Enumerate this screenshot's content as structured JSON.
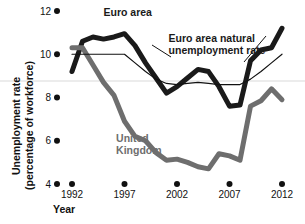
{
  "chart_data": {
    "type": "line",
    "title": "",
    "xlabel": "Year",
    "ylabel": "Unemployment rate (percentage of workforce)",
    "ylabel_line1": "Unemployment rate",
    "ylabel_line2": "(percentage of workforce)",
    "xlim": [
      1991,
      2012.6
    ],
    "ylim": [
      4,
      12
    ],
    "grid": "single horizontal reference line at 8.7",
    "gridline_value": 8.7,
    "x_ticks": [
      1992,
      1997,
      2002,
      2007,
      2012
    ],
    "x_tick_labels": [
      "1992",
      "1997",
      "2002",
      "2007",
      "2012"
    ],
    "y_ticks": [
      4,
      6,
      8,
      10,
      12
    ],
    "y_tick_labels": [
      "4",
      "6",
      "8",
      "10",
      "12"
    ],
    "legend_position": "inline annotations on curves",
    "series": [
      {
        "name": "Euro area",
        "label": "Euro area",
        "color": "#1a1a1a",
        "width": 5,
        "label_x": 1995.0,
        "label_y": 11.75,
        "x": [
          1992,
          1993,
          1994,
          1995,
          1996,
          1997,
          1998,
          1999,
          2000,
          2001,
          2002,
          2003,
          2004,
          2005,
          2006,
          2007,
          2008,
          2009,
          2010,
          2011,
          2012
        ],
        "values": [
          9.2,
          10.6,
          10.8,
          10.7,
          10.8,
          10.95,
          10.4,
          9.6,
          8.9,
          8.2,
          8.5,
          8.9,
          9.3,
          9.2,
          8.5,
          7.6,
          7.65,
          9.7,
          10.2,
          10.3,
          11.2
        ]
      },
      {
        "name": "Euro area natural unemployment rate",
        "label": "Euro area natural unemployment rate",
        "label_line1": "Euro area natural",
        "label_line2": "unemployment rate",
        "color": "#111111",
        "width": 1.2,
        "label_x": 2001.2,
        "label_y": 10.55,
        "x": [
          1992,
          1994,
          1996,
          1997,
          1998,
          1999,
          2000,
          2001,
          2002,
          2003,
          2004,
          2005,
          2006,
          2007,
          2008,
          2009,
          2010,
          2011,
          2012
        ],
        "values": [
          10.0,
          10.0,
          10.0,
          10.0,
          9.6,
          9.2,
          8.85,
          8.65,
          8.6,
          8.65,
          8.7,
          8.65,
          8.6,
          8.6,
          8.6,
          8.85,
          9.2,
          9.6,
          10.0
        ]
      },
      {
        "name": "United Kingdom",
        "label": "United Kingdom",
        "label_line1": "United",
        "label_line2": "Kingdom",
        "color": "#6e6e6e",
        "width": 5,
        "label_x": 1996.2,
        "label_y": 5.95,
        "x": [
          1992,
          1993,
          1994,
          1995,
          1996,
          1997,
          1998,
          1999,
          2000,
          2001,
          2002,
          2003,
          2004,
          2005,
          2006,
          2007,
          2008,
          2009,
          2010,
          2011,
          2012
        ],
        "values": [
          10.3,
          10.3,
          9.5,
          8.7,
          8.1,
          6.9,
          6.2,
          6.0,
          5.45,
          5.1,
          5.15,
          5.0,
          4.8,
          4.7,
          5.4,
          5.3,
          5.1,
          7.6,
          7.85,
          8.4,
          7.9
        ]
      }
    ]
  },
  "axes": {
    "x_axis_title": "Year",
    "y_axis_title_line1": "Unemployment rate",
    "y_axis_title_line2": "(percentage of workforce)"
  }
}
